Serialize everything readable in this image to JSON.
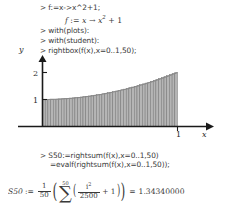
{
  "worksheet": {
    "application": "Maple worksheet",
    "lines": {
      "cmd1": "> f:=x->x^2+1;",
      "out1_prefix": "f",
      "out1_assign": " := ",
      "out1_var": "x",
      "out1_arrow": " → ",
      "out1_base": "x",
      "out1_exp": "2",
      "out1_tail": " + 1",
      "cmd2": "> with(plots):",
      "cmd3": "> with(student):",
      "cmd4": "> rightbox(f(x),x=0..1,50);",
      "cmd5": "> S50:=rightsum(f(x),x=0..1,50)",
      "cmd6": "=evalf(rightsum(f(x),x=0..1,50));"
    },
    "result": {
      "label": "S50",
      "assign": ":=",
      "frac_num": "1",
      "frac_den": "50",
      "sigma": "∑",
      "sigma_upper": "50",
      "sigma_lower": "i = 1",
      "inner_num": "i",
      "inner_num_exp": "2",
      "inner_den": "2500",
      "plus_one": "+ 1",
      "equals": "=",
      "value": "1.34340000"
    }
  },
  "chart_data": {
    "type": "area",
    "title": "",
    "xlabel": "x",
    "ylabel": "y",
    "xlim": [
      -0.18,
      1.22
    ],
    "ylim": [
      -0.28,
      2.45
    ],
    "xticks": [
      1
    ],
    "xticklabels": [
      "1"
    ],
    "yticks": [
      1,
      2
    ],
    "yticklabels": [
      "1",
      "2"
    ],
    "grid": false,
    "legend": false,
    "function": "f(x) = x^2 + 1",
    "riemann": {
      "method": "right",
      "interval": [
        0,
        1
      ],
      "n_rectangles": 50,
      "fill_color": "#b5b5b5",
      "edge_color": "#6e6e6e"
    },
    "axis_color": "#1a1a1a",
    "curve_color": "#8a8a8a"
  }
}
